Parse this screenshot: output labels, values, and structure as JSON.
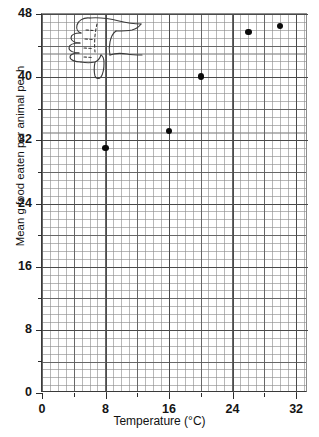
{
  "chart_data": {
    "type": "scatter",
    "title": "",
    "xlabel": "Temperature (°C)",
    "ylabel": "Mean g food eaten per animal per h",
    "xlim": [
      0,
      33.5
    ],
    "ylim": [
      0,
      48
    ],
    "grid": true,
    "grid_minor_step_x": 1,
    "grid_minor_step_y": 1,
    "grid_major_step_x": 4,
    "grid_major_step_y": 4,
    "legend": "none",
    "x_ticks": [
      0,
      8,
      16,
      24,
      32
    ],
    "x_tick_labels": [
      "0",
      "8",
      "16",
      "24",
      "32"
    ],
    "x_minor_ticks": [
      4,
      12,
      20,
      28
    ],
    "y_ticks": [
      0,
      8,
      16,
      24,
      32,
      40,
      48
    ],
    "y_tick_labels": [
      "0",
      "8",
      "16",
      "24",
      "32",
      "40",
      "48"
    ],
    "y_minor_ticks": [
      4,
      12,
      20,
      28,
      36,
      44
    ],
    "series": [
      {
        "name": "Mean g food eaten per animal per h",
        "marker": "filled-circle",
        "marker_color": "#0b0b0b",
        "points": [
          {
            "x": 8,
            "y": 31.0
          },
          {
            "x": 16,
            "y": 33.2
          },
          {
            "x": 20,
            "y": 40.1
          },
          {
            "x": 26,
            "y": 45.7
          },
          {
            "x": 30,
            "y": 46.5
          }
        ]
      }
    ],
    "annotations": [
      {
        "name": "thumbs-down-doodle",
        "type": "hand-drawn-sketch",
        "description": "thumbs down"
      }
    ]
  },
  "axes": {
    "x_title": "Temperature (°C)",
    "y_title": "Mean g food eaten per animal per h"
  }
}
